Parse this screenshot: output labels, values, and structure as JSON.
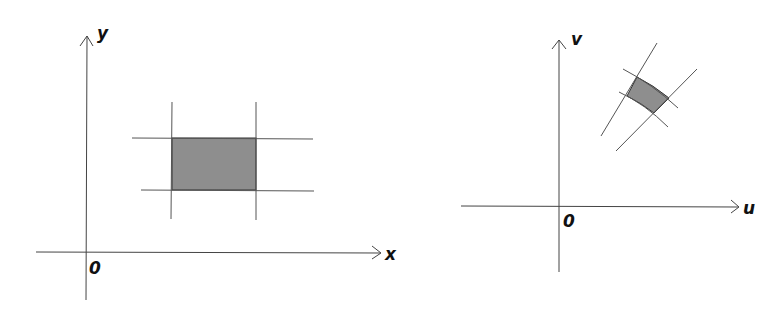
{
  "left_diagram": {
    "x_axis_label": "x",
    "y_axis_label": "y",
    "origin_label": "0",
    "region": "rectangle",
    "region_color": "#8e8e8e"
  },
  "right_diagram": {
    "x_axis_label": "u",
    "y_axis_label": "v",
    "origin_label": "0",
    "region": "curvilinear-quadrilateral",
    "region_color": "#8e8e8e"
  }
}
